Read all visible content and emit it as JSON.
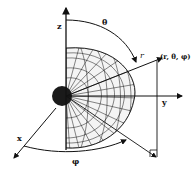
{
  "diagram": {
    "labels": {
      "z_axis": "z",
      "y_axis": "y",
      "x_axis": "x",
      "theta": "θ",
      "phi": "φ",
      "r": "r",
      "point": "(r, θ, φ)"
    },
    "colors": {
      "ink": "#111111",
      "background": "#ffffff"
    }
  }
}
